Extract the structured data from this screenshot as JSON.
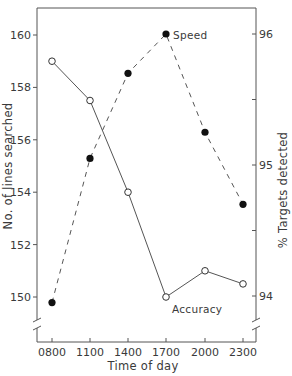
{
  "chart_data": {
    "type": "line",
    "title": "",
    "xlabel": "Time of day",
    "ylabel": "No. of lines searched",
    "y2label": "% Targets detected",
    "categories": [
      "0800",
      "1100",
      "1400",
      "1700",
      "2000",
      "2300"
    ],
    "ylim": [
      149,
      161
    ],
    "y2lim": [
      93.9,
      96.2
    ],
    "yticks": [
      150,
      152,
      154,
      156,
      158,
      160
    ],
    "y2ticks": [
      94,
      95,
      96
    ],
    "y2minor_ticks": [
      94.5,
      95.5
    ],
    "grid": false,
    "axis_breaks": true,
    "series": [
      {
        "name": "Accuracy",
        "axis": "left",
        "marker": "open-circle",
        "line_style": "solid",
        "values": [
          159.0,
          157.5,
          154.0,
          150.0,
          151.0,
          150.5
        ]
      },
      {
        "name": "Speed",
        "axis": "right",
        "marker": "filled-circle",
        "line_style": "dashed",
        "values": [
          93.95,
          95.05,
          95.7,
          96.0,
          95.25,
          94.7
        ]
      }
    ],
    "annotations": [
      {
        "text": "Speed",
        "near": "1700"
      },
      {
        "text": "Accuracy",
        "near": "1700"
      }
    ]
  },
  "colors": {
    "axis": "#555555",
    "line": "#555555",
    "marker_fill": "#111111",
    "text": "#3a3a3a"
  }
}
